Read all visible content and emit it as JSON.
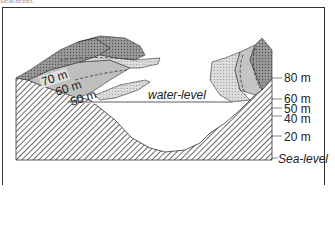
{
  "caption": "sea-level.",
  "diagram": {
    "water_label": "water-level",
    "sea_label": "Sea-level",
    "contour_labels": [
      "70 m",
      "60 m",
      "50 m"
    ],
    "scale_labels": [
      "80 m",
      "60 m",
      "50 m",
      "40 m",
      "20 m"
    ],
    "colors": {
      "border": "#333333",
      "hatch": "#555555",
      "light_band": "#d9d9d9",
      "mid_band": "#bdbdbd",
      "dark_band": "#8c8c8c",
      "water": "#ffffff"
    }
  }
}
